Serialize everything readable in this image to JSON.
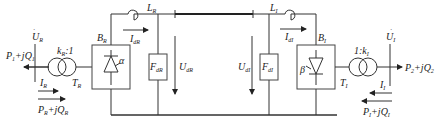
{
  "diagram": {
    "type": "circuit-schematic",
    "colors": {
      "line": "#333333",
      "background": "#ffffff"
    },
    "left_terminal": {
      "bus_voltage": {
        "main": "U",
        "sub": "R"
      },
      "ac_power_out": {
        "main": "P",
        "sub1": "1",
        "mid": "+jQ",
        "sub2": "1"
      },
      "current": {
        "main": "I",
        "sub": "R"
      },
      "power_in": {
        "main": "P",
        "sub1": "R",
        "mid": "+jQ",
        "sub2": "R"
      },
      "transformer_ratio": {
        "main": "k",
        "sub": "R",
        "suffix": ":1"
      },
      "transformer": {
        "main": "T",
        "sub": "R"
      },
      "converter": {
        "main": "B",
        "sub": "R"
      },
      "firing_angle": "α",
      "reactor": {
        "main": "L",
        "sub": "R"
      },
      "dc_current": {
        "main": "I",
        "sub": "dR"
      },
      "filter": {
        "main": "F",
        "sub": "dR"
      },
      "dc_voltage": {
        "main": "U",
        "sub": "dR"
      }
    },
    "right_terminal": {
      "bus_voltage": {
        "main": "U",
        "sub": "I"
      },
      "ac_power_out": {
        "main": "P",
        "sub1": "2",
        "mid": "+jQ",
        "sub2": "2"
      },
      "current": {
        "main": "I",
        "sub": "I"
      },
      "power_in": {
        "main": "P",
        "sub1": "I",
        "mid": "+jQ",
        "sub2": "I"
      },
      "transformer_ratio": {
        "prefix": "1:",
        "main": "k",
        "sub": "I"
      },
      "transformer": {
        "main": "T",
        "sub": "I"
      },
      "converter": {
        "main": "B",
        "sub": "I"
      },
      "extinction_angle": "β",
      "reactor": {
        "main": "L",
        "sub": "I"
      },
      "dc_current": {
        "main": "I",
        "sub": "dI"
      },
      "filter": {
        "main": "F",
        "sub": "dI"
      },
      "dc_voltage": {
        "main": "U",
        "sub": "dI"
      }
    }
  }
}
